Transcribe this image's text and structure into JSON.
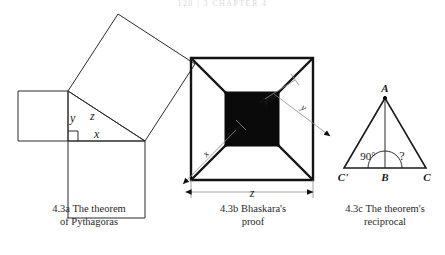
{
  "page": {
    "running_head": "120  |  3   CHAPTER 4",
    "footer_note": ""
  },
  "figures": [
    {
      "id": "fig-4-3a",
      "caption_line1": "4.3a The theorem",
      "caption_line2": "of Pythagoras",
      "labels": {
        "y": "y",
        "z": "z",
        "x": "x"
      },
      "description": "Right triangle with squares erected on each of its three sides",
      "right_angle_marker": true
    },
    {
      "id": "fig-4-3b",
      "caption_line1": "4.3b Bhaskara's",
      "caption_line2": "proof",
      "labels": {
        "y_minus_x": "y-x",
        "x": "x",
        "y": "y",
        "z": "z"
      },
      "description": "Square of side z subdivided into four right triangles around a central black square of side y minus x"
    },
    {
      "id": "fig-4-3c",
      "caption_line1": "4.3c The theorem's",
      "caption_line2": "reciprocal",
      "labels": {
        "apex": "A",
        "left_base": "C'",
        "mid_base": "B",
        "right_base": "C",
        "left_angle": "90°",
        "right_angle": "?"
      },
      "description": "Isosceles triangle A C' C with altitude AB, showing a right angle at left of B and an unknown angle at right"
    }
  ],
  "colors": {
    "ink": "#1a1a1a",
    "stroke": "#2b2b2b",
    "dimension_line": "#8b8b8b",
    "black_square_fill": "#0a0a0a",
    "paper": "#ffffff",
    "running_head": "#d8d8dc"
  }
}
